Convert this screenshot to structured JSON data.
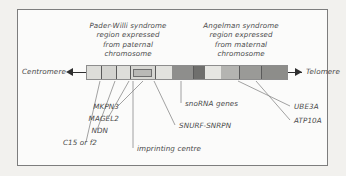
{
  "diagram": {
    "type": "genomic-map",
    "frame_color": "#7d7d7d",
    "text_color": "#4a4a4a"
  },
  "captions": {
    "left_region": "Pader-Willi syndrome\nregion expressed\nfrom paternal\nchromosome",
    "left_region_lines": [
      "Pader-Willi syndrome",
      "region expressed",
      "from paternal",
      "chromosome"
    ],
    "right_region_lines": [
      "Angelman syndrome",
      "region expressed",
      "from maternal",
      "chromosome"
    ]
  },
  "axis": {
    "left_end_label": "Centromere",
    "right_end_label": "Telomere"
  },
  "gene_labels": {
    "left": [
      {
        "name": "MKPN3"
      },
      {
        "name": "MAGEL2"
      },
      {
        "name": "NDN"
      },
      {
        "name": "C15 or f2"
      }
    ],
    "center": [
      {
        "name": "snoRNA genes"
      },
      {
        "name": "SNURF-SNRPN"
      },
      {
        "name": "imprinting centre"
      }
    ],
    "right": [
      {
        "name": "UBE3A"
      },
      {
        "name": "ATP10A"
      }
    ]
  },
  "chart_data": {
    "type": "diagram",
    "segments": [
      {
        "label": "pale-left-1",
        "x": 0,
        "w": 14,
        "color": "#ddddd9"
      },
      {
        "label": "pale-left-2",
        "x": 14,
        "w": 15,
        "color": "#d4d4d0"
      },
      {
        "label": "pale-left-3",
        "x": 29,
        "w": 14,
        "color": "#dedeDA"
      },
      {
        "label": "ic-block",
        "x": 43,
        "w": 25,
        "color": "#d6d6d2"
      },
      {
        "label": "pale-left-4",
        "x": 68,
        "w": 17,
        "color": "#e2e2de"
      },
      {
        "label": "dark-snorna",
        "x": 85,
        "w": 21,
        "color": "#8e8e8c"
      },
      {
        "label": "darker-band",
        "x": 106,
        "w": 12,
        "color": "#6f6f6d"
      },
      {
        "label": "light-band",
        "x": 118,
        "w": 16,
        "color": "#e6e6e2"
      },
      {
        "label": "mid-band",
        "x": 134,
        "w": 18,
        "color": "#b4b4b1"
      },
      {
        "label": "ube3a-band",
        "x": 152,
        "w": 22,
        "color": "#9a9a97"
      },
      {
        "label": "atp10a-band",
        "x": 174,
        "w": 26,
        "color": "#8d8d8a"
      }
    ],
    "tick_positions": [
      14,
      29,
      43,
      68,
      106,
      152,
      174
    ],
    "imprinting_centre_box": {
      "x": 46,
      "w": 19
    }
  }
}
